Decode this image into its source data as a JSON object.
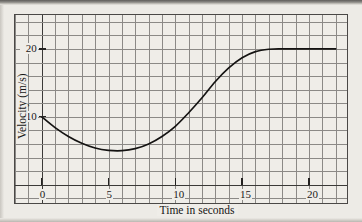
{
  "chart_data": {
    "type": "line",
    "title": "",
    "xlabel": "Time in seconds",
    "ylabel": "Velocity (m/s)",
    "xlim": [
      -2,
      23
    ],
    "ylim": [
      -3,
      25
    ],
    "xticks": [
      0,
      5,
      10,
      15,
      20
    ],
    "xtick_labels": [
      "0",
      "5",
      "10",
      "15",
      "20"
    ],
    "yticks": [
      10,
      20
    ],
    "ytick_labels": [
      "10",
      "20"
    ],
    "grid": true,
    "grid_spacing_x": 1,
    "grid_spacing_y": 2,
    "legend": null,
    "series": [
      {
        "name": "velocity",
        "color": "#141312",
        "x": [
          0,
          1,
          2,
          3,
          4,
          5,
          6,
          7,
          8,
          9,
          10,
          11,
          12,
          13,
          14,
          15,
          16,
          17,
          18,
          19,
          20,
          21,
          22
        ],
        "y": [
          10.0,
          8.4,
          7.1,
          6.1,
          5.4,
          5.05,
          5.0,
          5.3,
          6.0,
          7.1,
          8.6,
          10.6,
          12.8,
          15.2,
          17.2,
          18.7,
          19.6,
          19.95,
          20.0,
          20.0,
          20.0,
          20.0,
          20.0
        ]
      }
    ]
  },
  "axis": {
    "x_title": "Time in seconds",
    "y_title": "Velocity (m/s)",
    "x_labels": [
      "0",
      "5",
      "10",
      "15",
      "20"
    ],
    "y_labels": [
      "20",
      "10"
    ]
  },
  "colors": {
    "paper": "#eceae5",
    "plot_bg": "#efedE8",
    "grid": "#8b8986",
    "axis": "#3b3a38",
    "curve": "#141312",
    "text": "#171615"
  }
}
